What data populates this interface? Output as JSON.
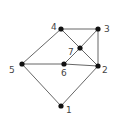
{
  "graph": {
    "nodes": [
      {
        "id": "1",
        "label": "1",
        "x": 61,
        "y": 106,
        "lx": 66,
        "ly": 113
      },
      {
        "id": "2",
        "label": "2",
        "x": 98,
        "y": 66,
        "lx": 102,
        "ly": 73
      },
      {
        "id": "3",
        "label": "3",
        "x": 98,
        "y": 29,
        "lx": 104,
        "ly": 32
      },
      {
        "id": "4",
        "label": "4",
        "x": 61,
        "y": 29,
        "lx": 51,
        "ly": 30
      },
      {
        "id": "5",
        "label": "5",
        "x": 22,
        "y": 64,
        "lx": 9,
        "ly": 73
      },
      {
        "id": "6",
        "label": "6",
        "x": 64,
        "y": 64,
        "lx": 61,
        "ly": 76
      },
      {
        "id": "7",
        "label": "7",
        "x": 80,
        "y": 48,
        "lx": 68,
        "ly": 55
      }
    ],
    "edges": [
      [
        "4",
        "3"
      ],
      [
        "4",
        "5"
      ],
      [
        "4",
        "7"
      ],
      [
        "3",
        "7"
      ],
      [
        "3",
        "2"
      ],
      [
        "7",
        "2"
      ],
      [
        "7",
        "6"
      ],
      [
        "5",
        "6"
      ],
      [
        "6",
        "2"
      ],
      [
        "5",
        "1"
      ],
      [
        "1",
        "2"
      ]
    ],
    "colors": {
      "edge": "#555555",
      "node": "#111111",
      "label": "#444444"
    }
  }
}
